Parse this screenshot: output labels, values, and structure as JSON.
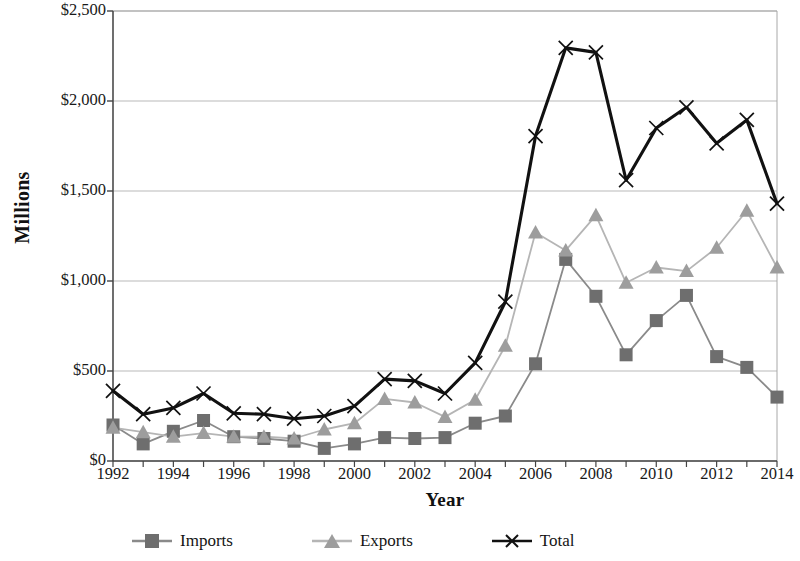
{
  "chart_data": {
    "type": "line",
    "title": "",
    "xlabel": "Year",
    "ylabel": "Millions",
    "x": [
      1992,
      1993,
      1994,
      1995,
      1996,
      1997,
      1998,
      1999,
      2000,
      2001,
      2002,
      2003,
      2004,
      2005,
      2006,
      2007,
      2008,
      2009,
      2010,
      2011,
      2012,
      2013,
      2014
    ],
    "xtick_labels": [
      "1992",
      "1994",
      "1996",
      "1998",
      "2000",
      "2002",
      "2004",
      "2006",
      "2008",
      "2010",
      "2012",
      "2014"
    ],
    "xtick_values": [
      1992,
      1994,
      1996,
      1998,
      2000,
      2002,
      2004,
      2006,
      2008,
      2010,
      2012,
      2014
    ],
    "xlim": [
      1992,
      2014
    ],
    "ytick_labels": [
      "$0",
      "$500",
      "$1,000",
      "$1,500",
      "$2,000",
      "$2,500"
    ],
    "ytick_values": [
      0,
      500,
      1000,
      1500,
      2000,
      2500
    ],
    "ylim": [
      0,
      2500
    ],
    "grid": "horizontal",
    "legend_position": "bottom",
    "series": [
      {
        "name": "Imports",
        "marker": "square",
        "color": "#6e6e6e",
        "line_color": "#8a8a8a",
        "values": [
          200,
          95,
          165,
          225,
          135,
          125,
          110,
          70,
          95,
          130,
          125,
          130,
          210,
          250,
          540,
          1120,
          915,
          590,
          780,
          920,
          580,
          520,
          355
        ]
      },
      {
        "name": "Exports",
        "marker": "triangle",
        "color": "#9d9d9d",
        "line_color": "#b5b5b5",
        "values": [
          185,
          160,
          135,
          155,
          135,
          135,
          125,
          175,
          210,
          345,
          325,
          245,
          340,
          640,
          1270,
          1170,
          1365,
          990,
          1075,
          1055,
          1185,
          1390,
          1075
        ]
      },
      {
        "name": "Total",
        "marker": "x",
        "color": "#111111",
        "line_color": "#111111",
        "values": [
          390,
          260,
          295,
          375,
          265,
          260,
          235,
          250,
          305,
          455,
          445,
          375,
          545,
          885,
          1805,
          2295,
          2270,
          1560,
          1850,
          1965,
          1765,
          1895,
          1430
        ]
      }
    ]
  },
  "legend": {
    "items": [
      {
        "label": "Imports"
      },
      {
        "label": "Exports"
      },
      {
        "label": "Total"
      }
    ]
  },
  "axis_titles": {
    "x": "Year",
    "y": "Millions"
  }
}
